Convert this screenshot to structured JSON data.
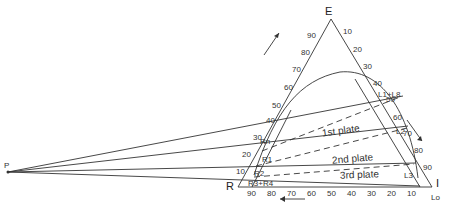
{
  "vertices": {
    "top": "E",
    "left": "R",
    "right": "I",
    "pole": "P"
  },
  "left_axis_ticks": [
    "90",
    "80",
    "70",
    "60",
    "50",
    "40",
    "30",
    "20",
    "10"
  ],
  "right_axis_ticks": [
    "10",
    "20",
    "30",
    "40",
    "50",
    "60",
    "70",
    "80",
    "90"
  ],
  "bottom_axis_ticks": [
    "90",
    "80",
    "70",
    "60",
    "50",
    "40",
    "30",
    "20",
    "10"
  ],
  "raffinate_labels": [
    "Rn",
    "R1",
    "R2",
    "R3+R4"
  ],
  "extract_labels": [
    "L1+L8",
    "L2",
    "L3",
    "Lo"
  ],
  "plates": [
    "1st plate",
    "2nd plate",
    "3rd plate"
  ]
}
